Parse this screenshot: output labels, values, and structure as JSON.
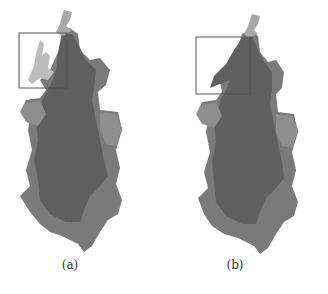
{
  "figure": {
    "panels": [
      {
        "id": "a",
        "caption": "(a)",
        "inset_box": {
          "x": 19,
          "y": 33,
          "w": 48,
          "h": 55
        },
        "description": "Map of region with overlaid segmentation; highlighted inset box at top-left"
      },
      {
        "id": "b",
        "caption": "(b)",
        "inset_box": {
          "x": 32,
          "y": 37,
          "w": 54,
          "h": 57
        },
        "description": "Map of region with alternative segmentation; highlighted inset box at top-left"
      }
    ],
    "colors": {
      "dark_region": "#5f5f5f",
      "medium_region": "#7a7a7a",
      "light_region": "#9a9a9a",
      "lightest_region": "#bdbdbd",
      "box_stroke": "#555555"
    }
  }
}
